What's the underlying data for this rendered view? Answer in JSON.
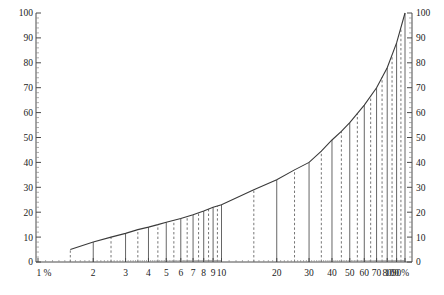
{
  "chart_data": {
    "type": "line",
    "title": "",
    "subtitle": "",
    "xlabel": "",
    "ylabel": "",
    "xscale": "log",
    "yscale": "linear",
    "xlim": [
      1,
      100
    ],
    "ylim": [
      0,
      100
    ],
    "grid": false,
    "legend": null,
    "x_unit": "%",
    "y_unit": "",
    "x_tick_labels": [
      "1 %",
      "2",
      "3",
      "4",
      "5",
      "6",
      "7",
      "8",
      "9",
      "10",
      "20",
      "30",
      "40",
      "50",
      "60",
      "70",
      "80",
      "90",
      "100 %"
    ],
    "x_tick_values": [
      1,
      2,
      3,
      4,
      5,
      6,
      7,
      8,
      9,
      10,
      20,
      30,
      40,
      50,
      60,
      70,
      80,
      90,
      100
    ],
    "y_tick_labels_left": [
      "0",
      "10",
      "20",
      "30",
      "40",
      "50",
      "60",
      "70",
      "80",
      "90",
      "100"
    ],
    "y_tick_values_left": [
      0,
      10,
      20,
      30,
      40,
      50,
      60,
      70,
      80,
      90,
      100
    ],
    "y_tick_labels_right": [
      "0",
      "10",
      "20",
      "30",
      "40",
      "50",
      "60",
      "70",
      "80",
      "90",
      "100"
    ],
    "y_tick_values_right": [
      0,
      10,
      20,
      30,
      40,
      50,
      60,
      70,
      80,
      90,
      100
    ],
    "series": [
      {
        "name": "curve",
        "style": "solid",
        "x": [
          1.5,
          2,
          2.5,
          3,
          3.5,
          4,
          4.5,
          5,
          6,
          7,
          8,
          9,
          10,
          15,
          20,
          25,
          30,
          35,
          40,
          45,
          50,
          60,
          70,
          80,
          90,
          100
        ],
        "values": [
          5.0,
          8.0,
          10.0,
          11.5,
          13.0,
          14.0,
          15.0,
          16.0,
          17.5,
          19.0,
          20.5,
          22.0,
          23.0,
          29.0,
          33.0,
          37.0,
          40.0,
          44.5,
          49.0,
          52.5,
          56.0,
          63.0,
          70.0,
          78.0,
          88.0,
          100.0
        ]
      }
    ],
    "vertical_lines_solid": [
      2,
      3,
      4,
      5,
      6,
      7,
      8,
      9,
      10,
      20,
      30,
      40,
      50,
      60,
      70,
      80,
      90,
      100
    ],
    "vertical_lines_dashed": [
      1.5,
      2.5,
      3.5,
      4.5,
      5.5,
      6.5,
      7.5,
      8.5,
      9.5,
      15,
      25,
      35,
      45,
      55,
      65,
      75,
      85,
      95
    ],
    "annotations": []
  },
  "colors": {
    "curve": "#3a3a3a",
    "axis": "#4a4a4a",
    "vline_solid": "#555555",
    "vline_dashed": "#666666",
    "background": "#ffffff",
    "text": "#222222"
  }
}
